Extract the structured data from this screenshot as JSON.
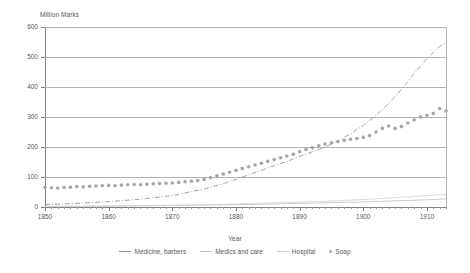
{
  "chart_data": {
    "type": "line",
    "title": "",
    "xlabel": "Year",
    "ylabel": "Million Marks",
    "ylim": [
      0,
      600
    ],
    "xlim": [
      1850,
      1913
    ],
    "yticks": [
      0,
      100,
      200,
      300,
      400,
      500,
      600
    ],
    "xticks": [
      1850,
      1860,
      1870,
      1880,
      1890,
      1900,
      1910
    ],
    "grid": true,
    "legend_position": "bottom",
    "series": [
      {
        "name": "Medicine, barbers",
        "style": "dash-dot",
        "color": "#8c8c8c",
        "x": [
          1850,
          1855,
          1860,
          1865,
          1870,
          1875,
          1878,
          1880,
          1882,
          1884,
          1886,
          1888,
          1890,
          1892,
          1894,
          1896,
          1898,
          1900,
          1902,
          1904,
          1906,
          1908,
          1910,
          1912,
          1913
        ],
        "values": [
          8,
          12,
          18,
          26,
          38,
          60,
          78,
          92,
          108,
          122,
          138,
          152,
          168,
          184,
          200,
          220,
          244,
          272,
          305,
          345,
          392,
          445,
          495,
          535,
          548
        ]
      },
      {
        "name": "Medics and care",
        "style": "solid",
        "color": "#bfbfbf",
        "x": [
          1850,
          1860,
          1870,
          1880,
          1890,
          1900,
          1910,
          1913
        ],
        "values": [
          2,
          3,
          5,
          8,
          12,
          17,
          24,
          27
        ]
      },
      {
        "name": "Hospital",
        "style": "solid",
        "color": "#d0d0d0",
        "x": [
          1850,
          1855,
          1860,
          1865,
          1870,
          1875,
          1880,
          1885,
          1890,
          1895,
          1900,
          1905,
          1910,
          1913
        ],
        "values": [
          1,
          2,
          3,
          4,
          6,
          8,
          10,
          13,
          16,
          20,
          25,
          31,
          38,
          42
        ]
      },
      {
        "name": "Soap",
        "style": "markers",
        "color": "#a6a6a6",
        "x": [
          1850,
          1851,
          1852,
          1853,
          1854,
          1855,
          1856,
          1857,
          1858,
          1859,
          1860,
          1861,
          1862,
          1863,
          1864,
          1865,
          1866,
          1867,
          1868,
          1869,
          1870,
          1871,
          1872,
          1873,
          1874,
          1875,
          1876,
          1877,
          1878,
          1879,
          1880,
          1881,
          1882,
          1883,
          1884,
          1885,
          1886,
          1887,
          1888,
          1889,
          1890,
          1891,
          1892,
          1893,
          1894,
          1895,
          1896,
          1897,
          1898,
          1899,
          1900,
          1901,
          1902,
          1903,
          1904,
          1905,
          1906,
          1907,
          1908,
          1909,
          1910,
          1911,
          1912,
          1913
        ],
        "values": [
          66,
          64,
          63,
          65,
          66,
          68,
          67,
          69,
          70,
          71,
          72,
          71,
          73,
          74,
          75,
          74,
          76,
          77,
          78,
          79,
          80,
          82,
          84,
          86,
          88,
          92,
          98,
          104,
          110,
          116,
          122,
          128,
          134,
          140,
          146,
          152,
          158,
          164,
          170,
          176,
          184,
          192,
          198,
          204,
          210,
          214,
          218,
          222,
          226,
          228,
          232,
          238,
          250,
          262,
          270,
          262,
          268,
          280,
          290,
          300,
          306,
          312,
          328,
          320
        ]
      }
    ]
  },
  "legend": {
    "items": [
      {
        "label": "Medicine, barbers",
        "marker": "dash-dot-line"
      },
      {
        "label": "Medics and care",
        "marker": "solid-line"
      },
      {
        "label": "Hospital",
        "marker": "solid-line"
      },
      {
        "label": "Soap",
        "marker": "dot"
      }
    ]
  }
}
